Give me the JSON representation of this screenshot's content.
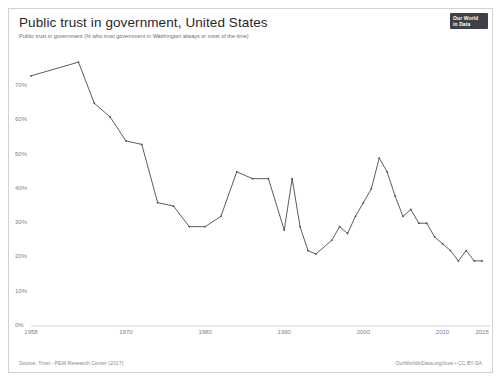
{
  "header": {
    "title": "Public trust in government, United States",
    "subtitle": "Public trust in government (% who trust government in Washington always or most of the time)",
    "logo_line1": "Our World",
    "logo_line2": "in Data"
  },
  "footer": {
    "source": "Source: Trust - PEW Research Center (2017)",
    "attribution": "OurWorldInData.org/trust • CC BY-SA"
  },
  "colors": {
    "line": "#4a4a50",
    "axis": "#c9c9ce",
    "tick_text": "#808085",
    "border": "#d2d2d2",
    "background": "#ffffff",
    "logo_background": "#3f3f46"
  },
  "chart_data": {
    "type": "line",
    "title": "Public trust in government, United States",
    "subtitle": "Public trust in government (% who trust government in Washington always or most of the time)",
    "xlabel": "",
    "ylabel": "",
    "xlim": [
      1958,
      2016
    ],
    "ylim": [
      0,
      75
    ],
    "grid": false,
    "legend": "none",
    "xticks": [
      1958,
      1970,
      1980,
      1990,
      2000,
      2010,
      2015
    ],
    "xtick_labels": [
      "1958",
      "1970",
      "1980",
      "1990",
      "2000",
      "2010",
      "2015"
    ],
    "yticks": [
      0,
      10,
      20,
      30,
      40,
      50,
      60,
      70
    ],
    "ytick_labels": [
      "0%",
      "10%",
      "20%",
      "30%",
      "40%",
      "50%",
      "60%",
      "70%"
    ],
    "series": [
      {
        "name": "Public trust in government",
        "color": "#4a4a50",
        "x": [
          1958,
          1964,
          1966,
          1968,
          1970,
          1972,
          1974,
          1976,
          1978,
          1980,
          1982,
          1984,
          1986,
          1988,
          1990,
          1991,
          1992,
          1993,
          1994,
          1996,
          1997,
          1998,
          1999,
          2000,
          2001,
          2002,
          2003,
          2004,
          2005,
          2006,
          2007,
          2008,
          2009,
          2010,
          2011,
          2012,
          2013,
          2014,
          2015
        ],
        "y": [
          73,
          77,
          65,
          61,
          54,
          53,
          36,
          33,
          29,
          27,
          33,
          44,
          43,
          41,
          28,
          43,
          29,
          22,
          21,
          30,
          38,
          36,
          40,
          44,
          49,
          56,
          36,
          47,
          34,
          30,
          29,
          25,
          22,
          22,
          19,
          22,
          19,
          24,
          19
        ],
        "y_read_from_pixels": [
          73,
          77,
          65,
          61,
          54,
          53,
          36,
          35,
          29,
          29,
          32,
          45,
          43,
          43,
          28,
          43,
          29,
          22,
          21,
          25,
          29,
          27,
          32,
          36,
          40,
          49,
          45,
          38,
          32,
          34,
          30,
          30,
          26,
          24,
          22,
          19,
          22,
          19,
          19
        ]
      }
    ]
  }
}
